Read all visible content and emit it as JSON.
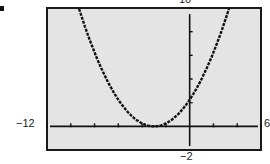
{
  "chart_data": {
    "type": "line",
    "title": "",
    "xlabel": "",
    "ylabel": "",
    "xlim": [
      -12,
      6
    ],
    "ylim": [
      -2,
      10
    ],
    "x_tick_step": 2,
    "y_tick_step": 2,
    "grid": false,
    "window_labels": {
      "xmin": "−12",
      "xmax": "6",
      "ymin": "−2",
      "ymax": "10"
    },
    "series": [
      {
        "name": "parabola",
        "style": "dotted-thick",
        "color": "#111111",
        "x": [
          -9.3,
          -9,
          -8,
          -7,
          -6,
          -5,
          -4,
          -3,
          -2,
          -1,
          0,
          1,
          2,
          3,
          3.3
        ],
        "values": [
          9.92,
          9.0,
          6.25,
          4.0,
          2.25,
          1.0,
          0.25,
          0.0,
          0.25,
          1.0,
          2.25,
          4.0,
          6.25,
          9.0,
          9.92
        ]
      }
    ],
    "colors": {
      "frame": "#1a1a1a",
      "plot_bg": "#e4e4e4",
      "axis": "#111111"
    }
  },
  "labels": {
    "xmin": "−12",
    "xmax": "6",
    "ymin": "−2",
    "ymax": "10"
  }
}
